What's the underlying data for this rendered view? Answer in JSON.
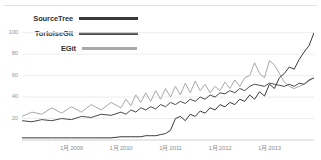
{
  "widget": {
    "name": "google-trends-interest-over-time"
  },
  "legend": {
    "position": "top-left",
    "items": [
      {
        "label": "SourceTree",
        "color": "#3a3a3a",
        "swatch_width": 62
      },
      {
        "label": "TortoiseGit",
        "color": "#4a4a4a",
        "swatch_width": 62
      },
      {
        "label": "EGit",
        "color": "#a8a8a8",
        "swatch_width": 55
      }
    ]
  },
  "chart_data": {
    "type": "line",
    "title": "",
    "subtitle": "",
    "xlabel": "",
    "ylabel": "",
    "grid": true,
    "ylim": [
      0,
      110
    ],
    "yticks": [
      100,
      80,
      60,
      40,
      20
    ],
    "ytick_labels": [
      "100",
      "80",
      "60",
      "40",
      "20"
    ],
    "xtick_labels": [
      "1月 2009",
      "1月 2010",
      "1月 2011",
      "1月 2012",
      "1月 2013"
    ],
    "xlim": [
      2008.0,
      2013.9
    ],
    "legend_position": "top-left",
    "series": [
      {
        "name": "SourceTree",
        "color": "#3a3a3a",
        "x": [
          2008.0,
          2008.2,
          2008.4,
          2008.6,
          2008.8,
          2009.0,
          2009.2,
          2009.4,
          2009.6,
          2009.8,
          2010.0,
          2010.1,
          2010.2,
          2010.3,
          2010.4,
          2010.5,
          2010.6,
          2010.7,
          2010.8,
          2010.9,
          2011.0,
          2011.1,
          2011.2,
          2011.3,
          2011.4,
          2011.5,
          2011.6,
          2011.7,
          2011.8,
          2011.9,
          2012.0,
          2012.1,
          2012.2,
          2012.3,
          2012.4,
          2012.5,
          2012.6,
          2012.7,
          2012.8,
          2012.9,
          2013.0,
          2013.1,
          2013.2,
          2013.3,
          2013.4,
          2013.5,
          2013.6,
          2013.7,
          2013.8,
          2013.9
        ],
        "values": [
          2,
          2,
          2,
          2,
          2,
          2,
          2,
          2,
          2,
          2,
          3,
          3,
          3,
          3,
          3,
          4,
          4,
          4,
          5,
          6,
          9,
          20,
          22,
          18,
          24,
          22,
          27,
          25,
          30,
          28,
          33,
          31,
          35,
          33,
          38,
          36,
          42,
          38,
          45,
          41,
          52,
          48,
          58,
          62,
          68,
          66,
          75,
          82,
          88,
          100
        ]
      },
      {
        "name": "TortoiseGit",
        "color": "#4a4a4a",
        "x": [
          2008.0,
          2008.2,
          2008.4,
          2008.6,
          2008.8,
          2009.0,
          2009.2,
          2009.4,
          2009.6,
          2009.8,
          2010.0,
          2010.1,
          2010.2,
          2010.3,
          2010.4,
          2010.5,
          2010.6,
          2010.7,
          2010.8,
          2010.9,
          2011.0,
          2011.1,
          2011.2,
          2011.3,
          2011.4,
          2011.5,
          2011.6,
          2011.7,
          2011.8,
          2011.9,
          2012.0,
          2012.1,
          2012.2,
          2012.3,
          2012.4,
          2012.5,
          2012.6,
          2012.7,
          2012.8,
          2012.9,
          2013.0,
          2013.1,
          2013.2,
          2013.3,
          2013.4,
          2013.5,
          2013.6,
          2013.7,
          2013.8,
          2013.9
        ],
        "values": [
          18,
          17,
          19,
          18,
          20,
          19,
          22,
          21,
          24,
          23,
          26,
          24,
          28,
          26,
          30,
          28,
          31,
          29,
          33,
          31,
          35,
          33,
          36,
          34,
          38,
          36,
          40,
          38,
          42,
          40,
          44,
          43,
          46,
          44,
          48,
          46,
          50,
          52,
          51,
          50,
          53,
          52,
          51,
          50,
          52,
          50,
          53,
          52,
          56,
          58
        ]
      },
      {
        "name": "EGit",
        "color": "#a8a8a8",
        "x": [
          2008.0,
          2008.2,
          2008.4,
          2008.6,
          2008.8,
          2009.0,
          2009.2,
          2009.4,
          2009.6,
          2009.8,
          2010.0,
          2010.1,
          2010.2,
          2010.3,
          2010.4,
          2010.5,
          2010.6,
          2010.7,
          2010.8,
          2010.9,
          2011.0,
          2011.1,
          2011.2,
          2011.3,
          2011.4,
          2011.5,
          2011.6,
          2011.7,
          2011.8,
          2011.9,
          2012.0,
          2012.1,
          2012.2,
          2012.3,
          2012.4,
          2012.5,
          2012.6,
          2012.7,
          2012.8,
          2012.9,
          2013.0,
          2013.1,
          2013.2,
          2013.3,
          2013.4,
          2013.5,
          2013.6,
          2013.7,
          2013.8,
          2013.9
        ],
        "values": [
          22,
          26,
          24,
          30,
          25,
          31,
          26,
          33,
          28,
          35,
          30,
          38,
          32,
          42,
          35,
          44,
          36,
          46,
          38,
          48,
          40,
          50,
          42,
          53,
          44,
          55,
          46,
          52,
          44,
          50,
          46,
          54,
          48,
          56,
          50,
          58,
          60,
          72,
          62,
          58,
          74,
          70,
          62,
          54,
          50,
          48,
          50,
          52,
          55,
          58
        ]
      }
    ]
  }
}
